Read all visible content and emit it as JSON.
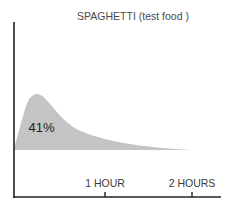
{
  "chart_data": {
    "type": "area",
    "title": "SPAGHETTI (test food )",
    "xlabel": "",
    "ylabel": "",
    "x_unit": "hours",
    "xlim": [
      -0.05,
      2.2
    ],
    "ylim": [
      0,
      1
    ],
    "grid": false,
    "legend": "none",
    "x_ticks": [
      {
        "value": 1,
        "label": "1 HOUR"
      },
      {
        "value": 2,
        "label": "2 HOURS"
      }
    ],
    "series": [
      {
        "name": "Blood glucose response",
        "color": "#c4c4c4",
        "x": [
          -0.05,
          0.05,
          0.12,
          0.2,
          0.28,
          0.36,
          0.45,
          0.55,
          0.7,
          0.9,
          1.1,
          1.3,
          1.5,
          1.7,
          1.85,
          2.0
        ],
        "y": [
          0.0,
          0.35,
          0.55,
          0.62,
          0.6,
          0.52,
          0.42,
          0.32,
          0.22,
          0.15,
          0.1,
          0.065,
          0.04,
          0.02,
          0.008,
          0.0
        ]
      }
    ],
    "annotations": [
      {
        "text": "41%",
        "x": 0.27,
        "y": 0.24
      }
    ]
  }
}
